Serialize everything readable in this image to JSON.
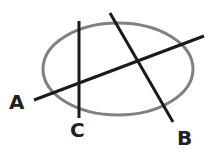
{
  "diagram": {
    "ellipse": {
      "cx": 118,
      "cy": 69,
      "rx": 75,
      "ry": 46,
      "stroke": "#808080"
    },
    "lines": [
      {
        "id": "A",
        "x1": 34,
        "y1": 100,
        "x2": 204,
        "y2": 36,
        "stroke": "#1a1a1a"
      },
      {
        "id": "B",
        "x1": 110,
        "y1": 13,
        "x2": 173,
        "y2": 122,
        "stroke": "#1a1a1a"
      },
      {
        "id": "C",
        "x1": 79,
        "y1": 21,
        "x2": 79,
        "y2": 118,
        "stroke": "#1a1a1a"
      }
    ],
    "labels": [
      {
        "text": "A",
        "x": 9,
        "y": 109
      },
      {
        "text": "B",
        "x": 177,
        "y": 145
      },
      {
        "text": "C",
        "x": 70,
        "y": 137
      }
    ]
  }
}
